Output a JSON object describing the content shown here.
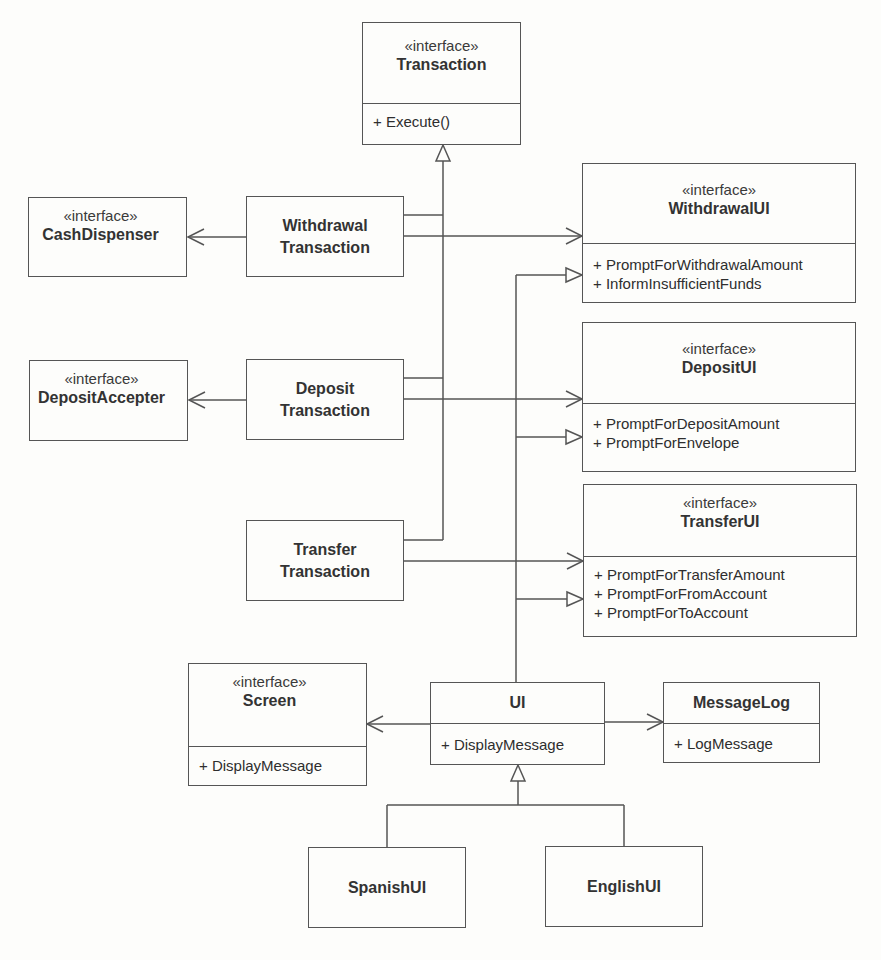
{
  "diagram": {
    "type": "UML class diagram",
    "classes": {
      "transaction": {
        "stereotype": "«interface»",
        "name": "Transaction",
        "operations": [
          "+ Execute()"
        ]
      },
      "cash_dispenser": {
        "stereotype": "«interface»",
        "name": "CashDispenser"
      },
      "withdrawal_transaction": {
        "name_line1": "Withdrawal",
        "name_line2": "Transaction"
      },
      "withdrawal_ui": {
        "stereotype": "«interface»",
        "name": "WithdrawalUI",
        "operations": [
          "+ PromptForWithdrawalAmount",
          "+ InformInsufficientFunds"
        ]
      },
      "deposit_accepter": {
        "stereotype": "«interface»",
        "name": "DepositAccepter"
      },
      "deposit_transaction": {
        "name_line1": "Deposit",
        "name_line2": "Transaction"
      },
      "deposit_ui": {
        "stereotype": "«interface»",
        "name": "DepositUI",
        "operations": [
          "+ PromptForDepositAmount",
          "+ PromptForEnvelope"
        ]
      },
      "transfer_transaction": {
        "name_line1": "Transfer",
        "name_line2": "Transaction"
      },
      "transfer_ui": {
        "stereotype": "«interface»",
        "name": "TransferUI",
        "operations": [
          "+ PromptForTransferAmount",
          "+ PromptForFromAccount",
          "+ PromptForToAccount"
        ]
      },
      "screen": {
        "stereotype": "«interface»",
        "name": "Screen",
        "operations": [
          "+ DisplayMessage"
        ]
      },
      "ui": {
        "name": "UI",
        "operations": [
          "+ DisplayMessage"
        ]
      },
      "message_log": {
        "name": "MessageLog",
        "operations": [
          "+ LogMessage"
        ]
      },
      "spanish_ui": {
        "name": "SpanishUI"
      },
      "english_ui": {
        "name": "EnglishUI"
      }
    },
    "relationships": [
      {
        "from": "WithdrawalTransaction",
        "to": "Transaction",
        "kind": "realization"
      },
      {
        "from": "DepositTransaction",
        "to": "Transaction",
        "kind": "realization"
      },
      {
        "from": "TransferTransaction",
        "to": "Transaction",
        "kind": "realization"
      },
      {
        "from": "WithdrawalTransaction",
        "to": "CashDispenser",
        "kind": "association"
      },
      {
        "from": "WithdrawalTransaction",
        "to": "WithdrawalUI",
        "kind": "association"
      },
      {
        "from": "DepositTransaction",
        "to": "DepositAccepter",
        "kind": "association"
      },
      {
        "from": "DepositTransaction",
        "to": "DepositUI",
        "kind": "association"
      },
      {
        "from": "TransferTransaction",
        "to": "TransferUI",
        "kind": "association"
      },
      {
        "from": "UI",
        "to": "WithdrawalUI",
        "kind": "realization"
      },
      {
        "from": "UI",
        "to": "DepositUI",
        "kind": "realization"
      },
      {
        "from": "UI",
        "to": "TransferUI",
        "kind": "realization"
      },
      {
        "from": "UI",
        "to": "Screen",
        "kind": "association"
      },
      {
        "from": "UI",
        "to": "MessageLog",
        "kind": "association"
      },
      {
        "from": "SpanishUI",
        "to": "UI",
        "kind": "generalization"
      },
      {
        "from": "EnglishUI",
        "to": "UI",
        "kind": "generalization"
      }
    ]
  }
}
